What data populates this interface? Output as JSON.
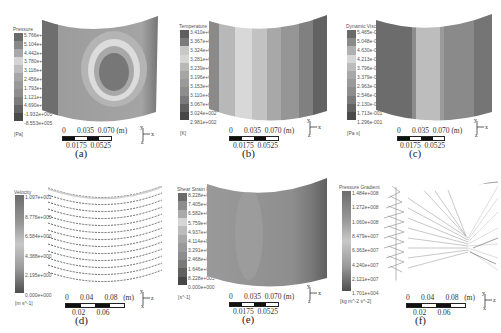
{
  "panels": {
    "a": {
      "caption": "(a)",
      "legend_title": "Pressure",
      "unit": "[Pa]",
      "ticks": [
        "5.766e+006",
        "5.104e+006",
        "4.442e+006",
        "3.780e+006",
        "3.118e+006",
        "2.456e+006",
        "1.793e+006",
        "1.121e+006",
        "4.690e+005",
        "-1.932e+005",
        "-8.553e+005"
      ],
      "scale_top": [
        "0",
        "0.035",
        "0.070 (m)"
      ],
      "scale_bottom": [
        "0.0175",
        "0.0525"
      ],
      "axes": {
        "up": "y",
        "right": "x",
        "down": "z"
      }
    },
    "b": {
      "caption": "(b)",
      "legend_title": "Temperature",
      "unit": "[K]",
      "ticks": [
        "3.410e+002",
        "3.367e+002",
        "3.324e+002",
        "3.281e+002",
        "3.239e+002",
        "3.196e+002",
        "3.153e+002",
        "3.110e+002",
        "3.067e+002",
        "3.024e+002",
        "2.981e+002"
      ],
      "scale_top": [
        "0",
        "0.035",
        "0.070 (m)"
      ],
      "scale_bottom": [
        "0.0175",
        "0.0525"
      ],
      "axes": {
        "up": "y",
        "right": "x",
        "down": "z"
      }
    },
    "c": {
      "caption": "(c)",
      "legend_title": "Dynamic Viscosity",
      "unit": "[Pa s]",
      "ticks": [
        "5.465e-001",
        "5.048e-001",
        "4.630e-001",
        "4.213e-001",
        "3.796e-001",
        "3.379e-001",
        "2.963e-001",
        "2.546e-001",
        "2.130e-001",
        "1.713e-001",
        "1.296e-001"
      ],
      "scale_top": [
        "0",
        "0.035",
        "0.070 (m)"
      ],
      "scale_bottom": [
        "0.0175",
        "0.0525"
      ],
      "axes": {
        "up": "y",
        "right": "x",
        "down": "z"
      }
    },
    "d": {
      "caption": "(d)",
      "legend_title": "Velocity",
      "unit": "[m s^-1]",
      "ticks": [
        "1.097e+001",
        "8.776e+000",
        "6.584e+000",
        "4.388e+000",
        "2.195e+000",
        "0.000e+000"
      ],
      "scale_top": [
        "0",
        "0.04",
        "0.08",
        "(m)"
      ],
      "scale_bottom": [
        "0.02",
        "0.06"
      ],
      "axes": {
        "up": "y",
        "right": "z",
        "down": "x"
      }
    },
    "e": {
      "caption": "(e)",
      "legend_title": "Shear Strain Rate",
      "unit": "[s^-1]",
      "ticks": [
        "8.228e+004",
        "7.405e+004",
        "6.582e+004",
        "5.759e+004",
        "4.937e+004",
        "4.114e+004",
        "3.291e+004",
        "2.468e+004",
        "1.646e+004",
        "8.228e+003",
        "0.000e+000"
      ],
      "scale_top": [
        "0",
        "0.035",
        "0.070 (m)"
      ],
      "scale_bottom": [
        "0.0175",
        "0.0525"
      ],
      "axes": {
        "up": "y",
        "right": "x",
        "down": "z"
      }
    },
    "f": {
      "caption": "(f)",
      "legend_title": "Pressure Gradient",
      "unit": "[kg m^-2 s^-2]",
      "ticks": [
        "1.484e+008",
        "1.272e+008",
        "1.060e+008",
        "8.479e+007",
        "6.363e+007",
        "4.240e+007",
        "2.121e+007",
        "1.701e+004"
      ],
      "scale_top": [
        "0",
        "0.04",
        "0.08",
        "(m)"
      ],
      "scale_bottom": [
        "0.02",
        "0.06"
      ],
      "axes": {
        "up": "y",
        "right": "z",
        "down": "x"
      }
    }
  },
  "colors": {
    "band_dark": "#5a5a5a",
    "band_mid": "#9c9c9c",
    "band_light": "#d8d8d8",
    "stream": "#555555"
  }
}
